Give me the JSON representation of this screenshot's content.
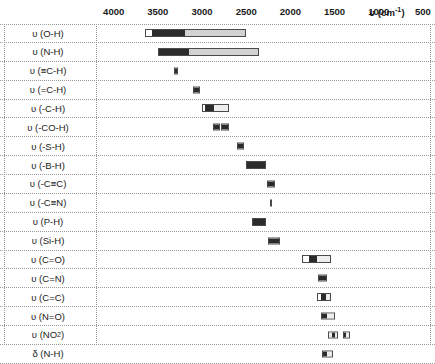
{
  "axis": {
    "unit_label": "υ (cm",
    "unit_sup": "-1",
    "unit_label_tail": ")",
    "unit_full": "υ (cm-1)",
    "ticks": [
      4000,
      3500,
      3000,
      2500,
      2000,
      1500,
      1000,
      500
    ],
    "range_min": 500,
    "range_max": 4200,
    "direction": "decreasing"
  },
  "chart_data": {
    "type": "bar",
    "xlabel": "υ (cm-1)",
    "ylabel": "",
    "xlim": [
      4200,
      420
    ],
    "grid": true,
    "legend": "none",
    "categories": [
      "υ (O-H)",
      "υ (N-H)",
      "υ (≡C-H)",
      "υ (=C-H)",
      "υ (-C-H)",
      "υ (-CO-H)",
      "υ (-S-H)",
      "υ (-B-H)",
      "υ (-C≡C)",
      "υ (-C≡N)",
      "υ (P-H)",
      "υ (Si-H)",
      "υ (C=O)",
      "υ (C=N)",
      "υ (C=C)",
      "υ (N=O)",
      "υ (NO2)",
      "δ (N-H)"
    ],
    "rows": [
      {
        "label": "υ (O-H)",
        "label_sub": "",
        "bands": [
          {
            "from": 3650,
            "to": 2500,
            "segments": [
              {
                "from": 3650,
                "to": 3580,
                "shade": "white"
              },
              {
                "from": 3580,
                "to": 3200,
                "shade": "dark"
              },
              {
                "from": 3200,
                "to": 2500,
                "shade": "light"
              }
            ]
          }
        ]
      },
      {
        "label": "υ (N-H)",
        "label_sub": "",
        "bands": [
          {
            "from": 3500,
            "to": 2350,
            "segments": [
              {
                "from": 3500,
                "to": 3150,
                "shade": "dark"
              },
              {
                "from": 3150,
                "to": 2350,
                "shade": "light"
              }
            ]
          }
        ]
      },
      {
        "label": "υ (≡C-H)",
        "label_sub": "",
        "bands": [
          {
            "from": 3320,
            "to": 3270,
            "segments": [
              {
                "from": 3320,
                "to": 3270,
                "shade": "dark"
              }
            ]
          }
        ]
      },
      {
        "label": "υ (=C-H)",
        "label_sub": "",
        "bands": [
          {
            "from": 3100,
            "to": 3020,
            "segments": [
              {
                "from": 3100,
                "to": 3020,
                "shade": "dark"
              }
            ]
          }
        ]
      },
      {
        "label": "υ (-C-H)",
        "label_sub": "",
        "bands": [
          {
            "from": 3000,
            "to": 2700,
            "segments": [
              {
                "from": 3000,
                "to": 2975,
                "shade": "white"
              },
              {
                "from": 2975,
                "to": 2860,
                "shade": "dark"
              },
              {
                "from": 2860,
                "to": 2700,
                "shade": "pale"
              }
            ]
          }
        ]
      },
      {
        "label": "υ (-CO-H)",
        "label_sub": "",
        "bands": [
          {
            "from": 2880,
            "to": 2800,
            "segments": [
              {
                "from": 2880,
                "to": 2800,
                "shade": "dark"
              }
            ]
          },
          {
            "from": 2780,
            "to": 2690,
            "segments": [
              {
                "from": 2780,
                "to": 2690,
                "shade": "dark"
              }
            ]
          }
        ]
      },
      {
        "label": "υ (-S-H)",
        "label_sub": "",
        "bands": [
          {
            "from": 2600,
            "to": 2520,
            "segments": [
              {
                "from": 2600,
                "to": 2520,
                "shade": "dark"
              }
            ]
          }
        ]
      },
      {
        "label": "υ (-B-H)",
        "label_sub": "",
        "bands": [
          {
            "from": 2500,
            "to": 2280,
            "segments": [
              {
                "from": 2500,
                "to": 2280,
                "shade": "dark"
              }
            ]
          }
        ]
      },
      {
        "label": "υ (-C≡C)",
        "label_sub": "",
        "bands": [
          {
            "from": 2260,
            "to": 2170,
            "segments": [
              {
                "from": 2260,
                "to": 2170,
                "shade": "dark"
              }
            ]
          }
        ]
      },
      {
        "label": "υ (-C≡N)",
        "label_sub": "",
        "bands": [
          {
            "from": 2230,
            "to": 2210,
            "segments": [
              {
                "from": 2230,
                "to": 2210,
                "shade": "dark"
              }
            ]
          }
        ]
      },
      {
        "label": "υ (P-H)",
        "label_sub": "",
        "bands": [
          {
            "from": 2440,
            "to": 2280,
            "segments": [
              {
                "from": 2440,
                "to": 2280,
                "shade": "dark"
              }
            ]
          }
        ]
      },
      {
        "label": "υ (Si-H)",
        "label_sub": "",
        "bands": [
          {
            "from": 2250,
            "to": 2120,
            "segments": [
              {
                "from": 2250,
                "to": 2120,
                "shade": "dark"
              }
            ]
          }
        ]
      },
      {
        "label": "υ (C=O)",
        "label_sub": "",
        "bands": [
          {
            "from": 1870,
            "to": 1540,
            "segments": [
              {
                "from": 1870,
                "to": 1790,
                "shade": "white"
              },
              {
                "from": 1790,
                "to": 1700,
                "shade": "dark"
              },
              {
                "from": 1700,
                "to": 1540,
                "shade": "pale"
              }
            ]
          }
        ]
      },
      {
        "label": "υ (C=N)",
        "label_sub": "",
        "bands": [
          {
            "from": 1690,
            "to": 1590,
            "segments": [
              {
                "from": 1690,
                "to": 1590,
                "shade": "dark"
              }
            ]
          }
        ]
      },
      {
        "label": "υ (C=C)",
        "label_sub": "",
        "bands": [
          {
            "from": 1700,
            "to": 1540,
            "segments": [
              {
                "from": 1700,
                "to": 1655,
                "shade": "white"
              },
              {
                "from": 1655,
                "to": 1590,
                "shade": "dark"
              },
              {
                "from": 1590,
                "to": 1540,
                "shade": "pale"
              }
            ]
          }
        ]
      },
      {
        "label": "υ (N=O)",
        "label_sub": "",
        "bands": [
          {
            "from": 1650,
            "to": 1500,
            "segments": [
              {
                "from": 1650,
                "to": 1590,
                "shade": "dark"
              },
              {
                "from": 1590,
                "to": 1500,
                "shade": "pale"
              }
            ]
          }
        ]
      },
      {
        "label": "υ (NO",
        "label_sub": "2",
        "label_tail": ")",
        "bands": [
          {
            "from": 1580,
            "to": 1460,
            "segments": [
              {
                "from": 1580,
                "to": 1530,
                "shade": "pale"
              },
              {
                "from": 1530,
                "to": 1490,
                "shade": "dark"
              },
              {
                "from": 1490,
                "to": 1460,
                "shade": "pale"
              }
            ]
          },
          {
            "from": 1410,
            "to": 1330,
            "segments": [
              {
                "from": 1410,
                "to": 1375,
                "shade": "dark"
              },
              {
                "from": 1375,
                "to": 1330,
                "shade": "pale"
              }
            ]
          }
        ]
      },
      {
        "label": "δ (N-H)",
        "label_sub": "",
        "bands": [
          {
            "from": 1640,
            "to": 1520,
            "segments": [
              {
                "from": 1640,
                "to": 1580,
                "shade": "dark"
              },
              {
                "from": 1580,
                "to": 1520,
                "shade": "pale"
              }
            ]
          }
        ]
      }
    ]
  }
}
